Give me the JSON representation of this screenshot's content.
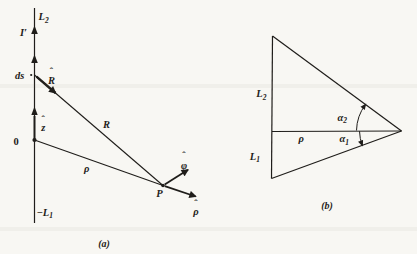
{
  "colors": {
    "background": "#f8f7f3",
    "ink": "#1f1d1a"
  },
  "a": {
    "caption": "(a)",
    "L2": {
      "base": "L",
      "sub": "2"
    },
    "current": "I′",
    "ds": "ds",
    "ds_dot": "·",
    "R_hat": {
      "hat": "ˆ",
      "letter": "R"
    },
    "R": "R",
    "z_hat": {
      "hat": "ˆ",
      "letter": "z"
    },
    "origin": "0",
    "rho": "ρ",
    "P": "P",
    "phi_hat": {
      "hat": "ˆ",
      "letter": "φ"
    },
    "rho_hat": {
      "hat": "ˆ",
      "letter": "ρ"
    },
    "neg_L1": {
      "base": "−L",
      "sub": "1"
    }
  },
  "b": {
    "caption": "(b)",
    "L2": {
      "base": "L",
      "sub": "2"
    },
    "L1": {
      "base": "L",
      "sub": "1"
    },
    "rho": "ρ",
    "alpha2": {
      "base": "α",
      "sub": "2"
    },
    "alpha1": {
      "base": "α",
      "sub": "1"
    }
  }
}
